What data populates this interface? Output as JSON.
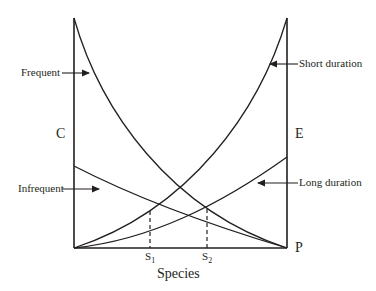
{
  "diagram": {
    "x_axis_label": "Species",
    "left_axis_label": "C",
    "right_axis_labels": {
      "upper": "E",
      "lower": "P"
    },
    "tick_labels": [
      {
        "main": "S",
        "sub": "1"
      },
      {
        "main": "S",
        "sub": "2"
      }
    ],
    "curves": [
      {
        "name": "frequent",
        "label": "Frequent",
        "color": "#231f20"
      },
      {
        "name": "infrequent",
        "label": "Infrequent",
        "color": "#231f20"
      },
      {
        "name": "short-duration",
        "label": "Short duration",
        "color": "#231f20"
      },
      {
        "name": "long-duration",
        "label": "Long duration",
        "color": "#231f20"
      }
    ]
  }
}
